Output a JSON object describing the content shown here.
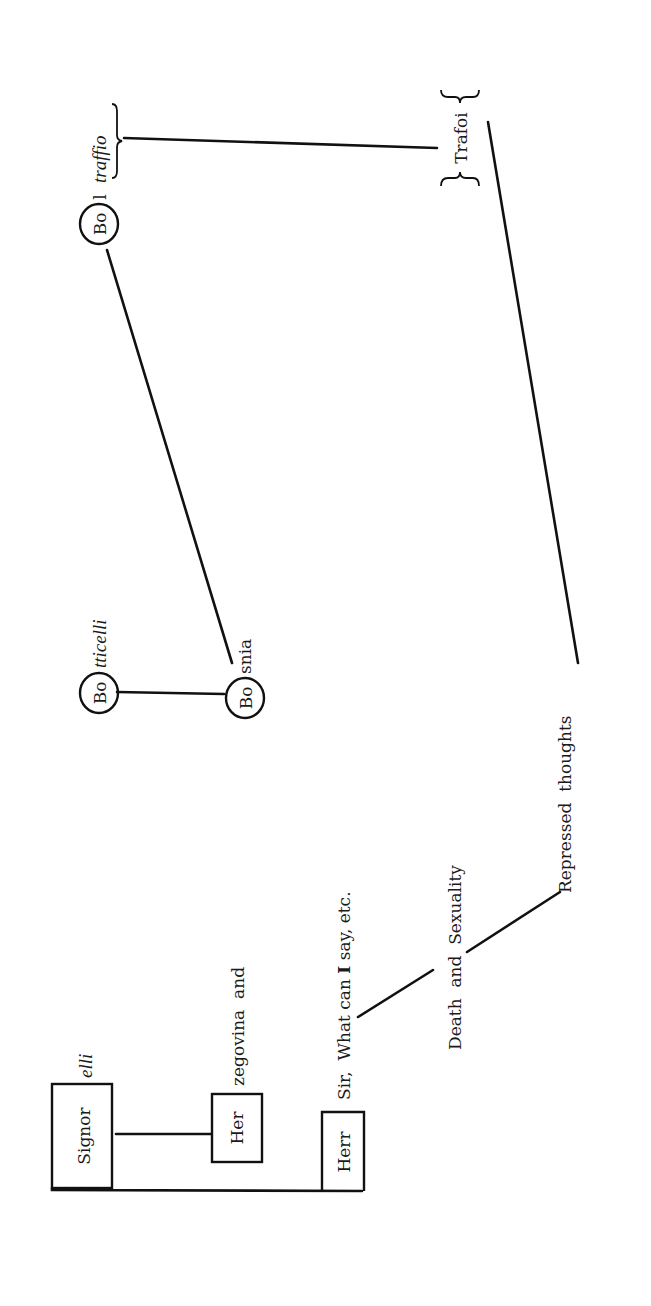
{
  "diagram": {
    "orientation": "rotated-90-ccw",
    "nodes": {
      "signorelli": {
        "boxed": "Signor",
        "suffix": "elli"
      },
      "herzegovina": {
        "boxed": "Her",
        "suffix": "zegovina  and"
      },
      "herr": {
        "boxed": "Herr",
        "suffix_pre": "Sir,  What can ",
        "suffix_bold": "I",
        "suffix_post": " say, etc."
      },
      "botticelli": {
        "circled": "Bo",
        "suffix": "tticelli"
      },
      "bosnia": {
        "circled": "Bo",
        "suffix": "snia"
      },
      "boltraffio": {
        "circled": "Bo",
        "middle": "l",
        "braced": "traffio"
      },
      "trafoi": {
        "braced": "Trafoi"
      },
      "death_sexuality": {
        "label": "Death  and  Sexuality"
      },
      "repressed": {
        "label": "Repressed  thoughts"
      }
    },
    "edges": [
      {
        "from": "Signor",
        "to": "Her"
      },
      {
        "from": "Signor",
        "to": "Herr"
      },
      {
        "from": "Herr",
        "to": "Death and Sexuality"
      },
      {
        "from": "Death and Sexuality",
        "to": "Repressed thoughts"
      },
      {
        "from": "Repressed thoughts",
        "to": "Trafoi"
      },
      {
        "from": "Trafoi",
        "to": "traffio"
      },
      {
        "from": "Bo (Boltraffio)",
        "to": "Bo (Bosnia)"
      },
      {
        "from": "Bo (Botticelli)",
        "to": "Bo (Bosnia)"
      }
    ]
  }
}
